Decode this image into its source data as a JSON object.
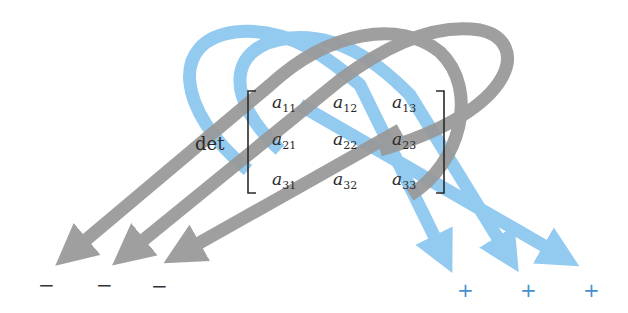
{
  "diagram": {
    "operator_label": "det",
    "matrix": [
      [
        {
          "base": "a",
          "sub": "11"
        },
        {
          "base": "a",
          "sub": "12"
        },
        {
          "base": "a",
          "sub": "13"
        }
      ],
      [
        {
          "base": "a",
          "sub": "21"
        },
        {
          "base": "a",
          "sub": "22"
        },
        {
          "base": "a",
          "sub": "23"
        }
      ],
      [
        {
          "base": "a",
          "sub": "31"
        },
        {
          "base": "a",
          "sub": "32"
        },
        {
          "base": "a",
          "sub": "33"
        }
      ]
    ],
    "negative_signs": [
      "−",
      "−",
      "−"
    ],
    "positive_signs": [
      "+",
      "+",
      "+"
    ],
    "colors": {
      "positive_arrow": "#8ec8f0",
      "negative_arrow": "#9a9a9a",
      "positive_sign": "#4a8fd0",
      "negative_sign": "#333333",
      "text": "#2a2a2a"
    }
  }
}
